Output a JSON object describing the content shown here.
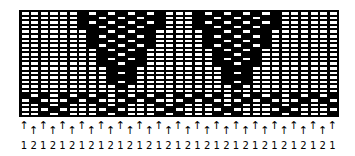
{
  "chart": {
    "title": "",
    "columns": 33,
    "rows": 23,
    "colors": {
      "background": "#000000",
      "light": "#ffffff",
      "dark": "#000000"
    },
    "motifs": [
      {
        "type": "triangle",
        "cols": [
          6,
          14
        ],
        "rows": [
          0,
          16
        ]
      },
      {
        "type": "triangle",
        "cols": [
          18,
          26
        ],
        "rows": [
          0,
          16
        ]
      },
      {
        "type": "zigzag-band",
        "rows": [
          18,
          22
        ],
        "period": 12
      }
    ]
  },
  "footer": {
    "arrow_glyph": "↑",
    "column_labels": [
      "1",
      "2",
      "1",
      "2",
      "1",
      "2",
      "1",
      "2",
      "1",
      "2",
      "1",
      "2",
      "1",
      "2",
      "1",
      "2",
      "1",
      "2",
      "1",
      "2",
      "1",
      "2",
      "1",
      "2",
      "1",
      "2",
      "1",
      "2",
      "1",
      "2",
      "1",
      "2",
      "1"
    ]
  }
}
